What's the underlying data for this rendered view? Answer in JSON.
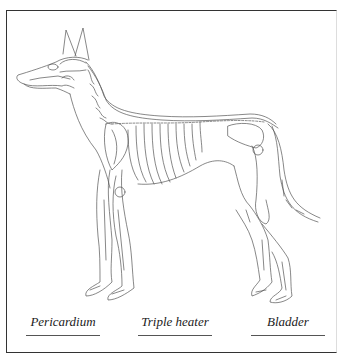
{
  "figure": {
    "labels": [
      {
        "text": "Pericardium"
      },
      {
        "text": "Triple heater"
      },
      {
        "text": "Bladder"
      }
    ]
  },
  "colors": {
    "line": "#444444",
    "frame": "#333333",
    "background": "#ffffff"
  }
}
